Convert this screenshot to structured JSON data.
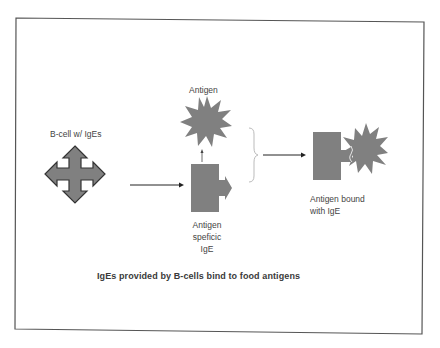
{
  "diagram": {
    "colors": {
      "frame": "#555555",
      "shape_fill": "#808080",
      "shape_stroke": "#333333",
      "arrow": "#222222",
      "brace": "#bbbbbb",
      "text": "#444444"
    },
    "nodes": [
      {
        "id": "bcell",
        "shape": "four-way-arrow",
        "label": "B-cell w/ IgEs"
      },
      {
        "id": "antigen",
        "shape": "star-burst",
        "label": "Antigen"
      },
      {
        "id": "ige",
        "shape": "rectangle-with-arrow",
        "label_lines": [
          "Antigen",
          "speficic",
          "IgE"
        ]
      },
      {
        "id": "bound",
        "shape": "rectangle-with-star",
        "label_lines": [
          "Antigen bound",
          "with IgE"
        ]
      }
    ],
    "edges": [
      {
        "from": "bcell",
        "to": "ige",
        "type": "arrow"
      },
      {
        "from": "ige",
        "to": "antigen",
        "type": "arrow"
      },
      {
        "from": "brace",
        "to": "bound",
        "type": "arrow"
      }
    ],
    "caption": "IgEs provided by B-cells bind to food antigens"
  }
}
